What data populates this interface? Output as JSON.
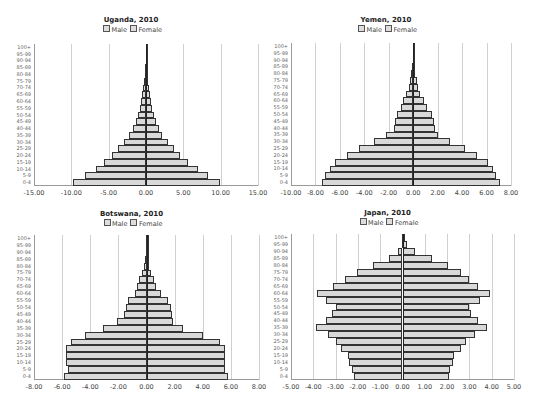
{
  "legend": {
    "male": "Male",
    "female": "Female"
  },
  "age_groups": [
    "0-4",
    "5-9",
    "10-14",
    "15-19",
    "20-24",
    "25-29",
    "30-34",
    "35-39",
    "40-44",
    "45-49",
    "50-54",
    "55-59",
    "60-64",
    "65-69",
    "70-74",
    "75-79",
    "80-84",
    "85-89",
    "90-94",
    "95-99",
    "100+"
  ],
  "chart_data": [
    {
      "type": "bar",
      "orientation": "horizontal-pyramid",
      "title": "Uganda, 2010",
      "legend": [
        "Male",
        "Female"
      ],
      "categories": [
        "0-4",
        "5-9",
        "10-14",
        "15-19",
        "20-24",
        "25-29",
        "30-34",
        "35-39",
        "40-44",
        "45-49",
        "50-54",
        "55-59",
        "60-64",
        "65-69",
        "70-74",
        "75-79",
        "80-84",
        "85-89",
        "90-94",
        "95-99",
        "100+"
      ],
      "series": [
        {
          "name": "Male",
          "values": [
            -9.8,
            -8.2,
            -6.7,
            -5.6,
            -4.5,
            -3.7,
            -2.9,
            -2.3,
            -1.7,
            -1.4,
            -1.1,
            -0.8,
            -0.65,
            -0.5,
            -0.35,
            -0.25,
            -0.15,
            -0.08,
            -0.04,
            -0.02,
            -0.01
          ]
        },
        {
          "name": "Female",
          "values": [
            9.9,
            8.3,
            6.9,
            5.6,
            4.6,
            3.7,
            2.9,
            2.2,
            1.7,
            1.4,
            1.1,
            0.8,
            0.65,
            0.5,
            0.35,
            0.25,
            0.15,
            0.08,
            0.04,
            0.02,
            0.01
          ]
        }
      ],
      "xticks": [
        "-15.00",
        "-10.00",
        "-5.00",
        "0.00",
        "5.00",
        "10.00",
        "15.00"
      ],
      "xlim": [
        -15,
        15
      ],
      "grid": true,
      "legend_position": "top"
    },
    {
      "type": "bar",
      "orientation": "horizontal-pyramid",
      "title": "Yemen, 2010",
      "legend": [
        "Male",
        "Female"
      ],
      "categories": [
        "0-4",
        "5-9",
        "10-14",
        "15-19",
        "20-24",
        "25-29",
        "30-34",
        "35-39",
        "40-44",
        "45-49",
        "50-54",
        "55-59",
        "60-64",
        "65-69",
        "70-74",
        "75-79",
        "80-84",
        "85-89",
        "90-94",
        "95-99",
        "100+"
      ],
      "series": [
        {
          "name": "Male",
          "values": [
            -7.5,
            -7.2,
            -6.8,
            -6.4,
            -5.4,
            -4.4,
            -3.2,
            -2.2,
            -1.6,
            -1.5,
            -1.3,
            -1.0,
            -0.8,
            -0.57,
            -0.38,
            -0.27,
            -0.18,
            -0.08,
            -0.04,
            -0.02,
            -0.01
          ]
        },
        {
          "name": "Female",
          "values": [
            7.1,
            6.8,
            6.5,
            6.1,
            5.2,
            4.2,
            3.0,
            2.0,
            1.8,
            1.7,
            1.5,
            1.1,
            0.9,
            0.55,
            0.38,
            0.27,
            0.18,
            0.08,
            0.04,
            0.02,
            0.01
          ]
        }
      ],
      "xticks": [
        "-10.00",
        "-8.00",
        "-6.00",
        "-4.00",
        "-2.00",
        "0.00",
        "2.00",
        "4.00",
        "6.00",
        "8.00"
      ],
      "xlim": [
        -10,
        8
      ],
      "grid": true,
      "legend_position": "top"
    },
    {
      "type": "bar",
      "orientation": "horizontal-pyramid",
      "title": "Botswana, 2010",
      "legend": [
        "Male",
        "Female"
      ],
      "categories": [
        "0-4",
        "5-9",
        "10-14",
        "15-19",
        "20-24",
        "25-29",
        "30-34",
        "35-39",
        "40-44",
        "45-49",
        "50-54",
        "55-59",
        "60-64",
        "65-69",
        "70-74",
        "75-79",
        "80-84",
        "85-89",
        "90-94",
        "95-99",
        "100+"
      ],
      "series": [
        {
          "name": "Male",
          "values": [
            -5.9,
            -5.6,
            -5.7,
            -5.7,
            -5.7,
            -5.4,
            -4.4,
            -3.1,
            -2.1,
            -1.6,
            -1.45,
            -1.35,
            -0.85,
            -0.67,
            -0.5,
            -0.33,
            -0.2,
            -0.1,
            -0.04,
            -0.02,
            -0.01
          ]
        },
        {
          "name": "Female",
          "values": [
            5.8,
            5.6,
            5.6,
            5.6,
            5.6,
            5.2,
            4.0,
            2.6,
            1.9,
            1.8,
            1.75,
            1.55,
            1.0,
            0.7,
            0.5,
            0.3,
            0.2,
            0.15,
            0.06,
            0.02,
            0.01
          ]
        }
      ],
      "xticks": [
        "-8.00",
        "-6.00",
        "-4.00",
        "-2.00",
        "0.00",
        "2.00",
        "4.00",
        "6.00",
        "8.00"
      ],
      "xlim": [
        -8,
        8
      ],
      "grid": true,
      "legend_position": "top"
    },
    {
      "type": "bar",
      "orientation": "horizontal-pyramid",
      "title": "Japan, 2010",
      "legend": [
        "Male",
        "Female"
      ],
      "categories": [
        "0-4",
        "5-9",
        "10-14",
        "15-19",
        "20-24",
        "25-29",
        "30-34",
        "35-39",
        "40-44",
        "45-49",
        "50-54",
        "55-59",
        "60-64",
        "65-69",
        "70-74",
        "75-79",
        "80-84",
        "85-89",
        "90-94",
        "95-99",
        "100+"
      ],
      "series": [
        {
          "name": "Male",
          "values": [
            -2.17,
            -2.26,
            -2.4,
            -2.44,
            -2.75,
            -3.0,
            -3.34,
            -3.86,
            -3.44,
            -3.16,
            -3.0,
            -3.41,
            -3.82,
            -3.11,
            -2.56,
            -2.05,
            -1.32,
            -0.6,
            -0.18,
            -0.02,
            -0.01
          ]
        },
        {
          "name": "Female",
          "values": [
            2.07,
            2.14,
            2.28,
            2.33,
            2.62,
            2.86,
            3.23,
            3.77,
            3.4,
            3.08,
            2.99,
            3.47,
            3.94,
            3.4,
            2.96,
            2.62,
            2.05,
            1.32,
            0.58,
            0.21,
            0.03
          ]
        }
      ],
      "xticks": [
        "-5.00",
        "-4.00",
        "-3.00",
        "-2.00",
        "-1.00",
        "0.00",
        "1.00",
        "2.00",
        "3.00",
        "4.00",
        "5.00"
      ],
      "xlim": [
        -5,
        5
      ],
      "grid": true,
      "legend_position": "top"
    }
  ],
  "layout": [
    {
      "left": 34,
      "top": 44,
      "width": 224,
      "height": 142,
      "title_top": 16,
      "legend_top": 25
    },
    {
      "left": 291,
      "top": 43,
      "width": 220,
      "height": 143,
      "title_top": 16,
      "legend_top": 25
    },
    {
      "left": 34,
      "top": 235,
      "width": 225,
      "height": 145,
      "title_top": 210,
      "legend_top": 219
    },
    {
      "left": 291,
      "top": 234,
      "width": 223,
      "height": 146,
      "title_top": 209,
      "legend_top": 218
    }
  ]
}
